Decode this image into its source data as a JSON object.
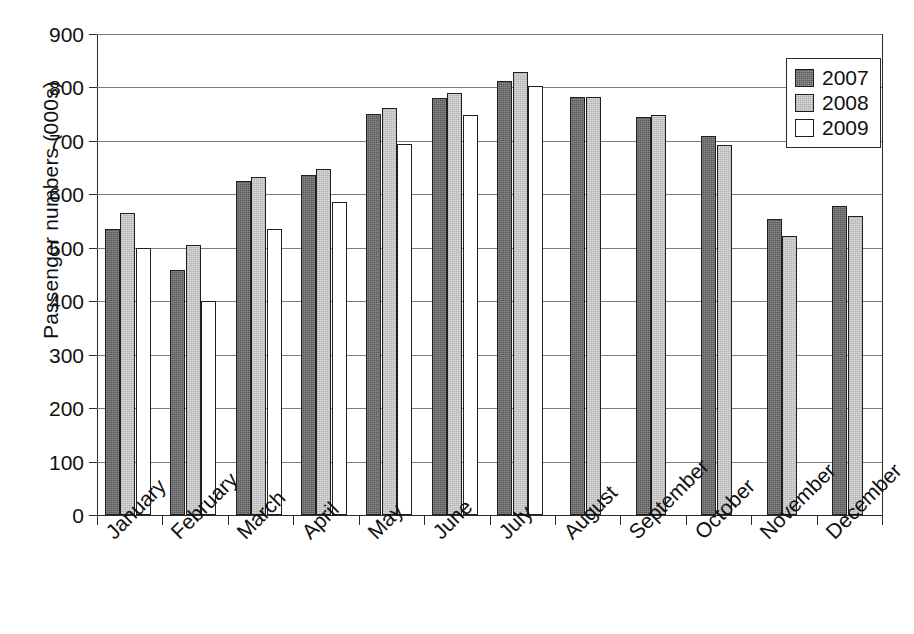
{
  "chart_data": {
    "type": "bar",
    "title": "",
    "subtitle": "",
    "xlabel": "",
    "ylabel": "Passenger numbers (000s)",
    "ylim": [
      0,
      900
    ],
    "ytick_step": 100,
    "yticks": [
      0,
      100,
      200,
      300,
      400,
      500,
      600,
      700,
      800,
      900
    ],
    "ytick_labels": [
      "0",
      "100",
      "200",
      "300",
      "400",
      "500",
      "600",
      "700",
      "800",
      "900"
    ],
    "grid": "horizontal",
    "legend_position": "top-right",
    "categories": [
      "January",
      "February",
      "March",
      "April",
      "May",
      "June",
      "July",
      "August",
      "September",
      "October",
      "November",
      "December"
    ],
    "series": [
      {
        "name": "2007",
        "color": "#5a5a5c",
        "values": [
          535,
          458,
          625,
          637,
          750,
          780,
          812,
          782,
          745,
          710,
          553,
          578
        ]
      },
      {
        "name": "2008",
        "color": "#dadada",
        "values": [
          565,
          505,
          632,
          648,
          762,
          790,
          828,
          782,
          748,
          693,
          523,
          560
        ]
      },
      {
        "name": "2009",
        "color": "#ffffff",
        "values": [
          500,
          400,
          535,
          585,
          695,
          748,
          802,
          null,
          null,
          null,
          null,
          null
        ]
      }
    ]
  },
  "legend": {
    "entries": [
      {
        "label": "2007",
        "swatch": "dark-gray-swatch"
      },
      {
        "label": "2008",
        "swatch": "light-gray-swatch"
      },
      {
        "label": "2009",
        "swatch": "white-swatch"
      }
    ]
  },
  "axes": {
    "y_title": "Passenger numbers (000s)"
  }
}
